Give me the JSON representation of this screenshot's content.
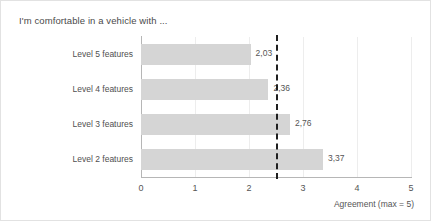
{
  "chart_data": {
    "type": "bar",
    "orientation": "horizontal",
    "title": "I'm comfortable in a vehicle with ...",
    "xlabel": "Agreement (max = 5)",
    "ylabel": "",
    "xlim": [
      0,
      5
    ],
    "xticks": [
      "0",
      "1",
      "2",
      "3",
      "4",
      "5"
    ],
    "grid": true,
    "legend": false,
    "categories": [
      "Level 5 features",
      "Level 4 features",
      "Level 3 features",
      "Level 2 features"
    ],
    "values": [
      2.03,
      2.36,
      2.76,
      3.37
    ],
    "value_labels": [
      "2,03",
      "2,36",
      "2,76",
      "3,37"
    ],
    "bars": [
      {
        "category": "Level 5 features",
        "value": 2.03,
        "label": "2,03"
      },
      {
        "category": "Level 4 features",
        "value": 2.36,
        "label": "2,36"
      },
      {
        "category": "Level 3 features",
        "value": 2.76,
        "label": "2,76"
      },
      {
        "category": "Level 2 features",
        "value": 3.37,
        "label": "3,37"
      }
    ],
    "reference_line": {
      "value": 2.5,
      "style": "dashed",
      "color": "#1f1f1f"
    },
    "colors": {
      "bar_fill": "#d5d5d5",
      "gridline": "#ededed",
      "axis": "#b6b6b6",
      "text": "#555555",
      "title_text": "#4a4a4a",
      "background": "#ffffff",
      "border": "#e2e2e2"
    }
  }
}
